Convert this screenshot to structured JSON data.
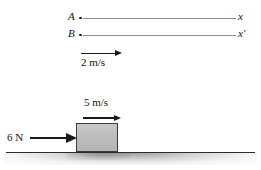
{
  "figure": {
    "kind": "physics-free-body-and-reference-frames-diagram",
    "background_color": "#ffffff",
    "width": 261,
    "height": 170
  },
  "frames": {
    "top_rail": {
      "origin_label": "A",
      "axis_label": "x",
      "line_color": "#8d8d8d"
    },
    "bottom_rail": {
      "origin_label": "B",
      "axis_label": "x′",
      "line_color": "#8d8d8d"
    },
    "relative_velocity": {
      "label": "2 m/s",
      "direction": "right",
      "arrow_color": "#1a1a1a"
    }
  },
  "scene": {
    "velocity": {
      "label": "5 m/s",
      "direction": "right",
      "arrow_color": "#1a1a1a"
    },
    "force": {
      "label": "6 N",
      "direction": "right",
      "arrow_color": "#1a1a1a"
    },
    "block": {
      "fill_color": "#bdbdbd",
      "border_color": "#3a3a3a"
    },
    "ground": {
      "line_color": "#2b2b2b"
    }
  }
}
